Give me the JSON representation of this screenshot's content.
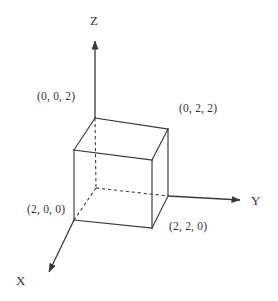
{
  "figure": {
    "kind": "3d-cube-coordinate-diagram",
    "width": 278,
    "height": 301,
    "background_color": "#ffffff",
    "stroke_color": "#3a3a3a",
    "text_color": "#333333"
  },
  "axes": [
    {
      "id": "x",
      "label": "X",
      "direction": "down-left",
      "arrow": true
    },
    {
      "id": "y",
      "label": "Y",
      "direction": "right",
      "arrow": true
    },
    {
      "id": "z",
      "label": "Z",
      "direction": "up",
      "arrow": true
    }
  ],
  "vertex_labels": [
    {
      "id": "v002",
      "text": "(0, 0, 2)",
      "vertex": "back-top-origin-column"
    },
    {
      "id": "v022",
      "text": "(0, 2, 2)",
      "vertex": "back-top-right"
    },
    {
      "id": "v200",
      "text": "(2, 0, 0)",
      "vertex": "front-bottom-left"
    },
    {
      "id": "v220",
      "text": "(2, 2, 0)",
      "vertex": "front-bottom-right"
    }
  ],
  "cube": {
    "edge_style_visible": "solid",
    "edge_style_hidden": "dashed",
    "side_length_units": 2,
    "vertices": {
      "back_top_left": [
        95,
        118
      ],
      "back_top_right": [
        168,
        129
      ],
      "front_top_left": [
        74,
        150
      ],
      "front_top_right": [
        152,
        160
      ],
      "back_bottom_left": [
        96,
        188
      ],
      "back_bottom_right": [
        168,
        196
      ],
      "front_bottom_left": [
        74,
        220
      ],
      "front_bottom_right": [
        152,
        228
      ]
    }
  }
}
